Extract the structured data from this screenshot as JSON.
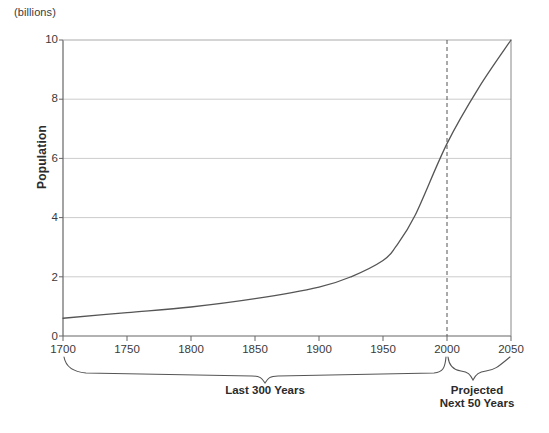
{
  "chart_data": {
    "type": "line",
    "title": "",
    "subtitle": "",
    "units_note": "(billions)",
    "xlabel": "",
    "ylabel": "Population",
    "xlim": [
      1700,
      2050
    ],
    "ylim": [
      0,
      10
    ],
    "grid": true,
    "grid_axis": "y",
    "legend": "none",
    "x_ticks": [
      "1700",
      "1750",
      "1800",
      "1850",
      "1900",
      "1950",
      "2000",
      "2050"
    ],
    "x_tick_values": [
      1700,
      1750,
      1800,
      1850,
      1900,
      1950,
      2000,
      2050
    ],
    "y_ticks": [
      "0",
      "2",
      "4",
      "6",
      "8",
      "10"
    ],
    "y_tick_values": [
      0,
      2,
      4,
      6,
      8,
      10
    ],
    "series": [
      {
        "name": "World Population",
        "x": [
          1700,
          1750,
          1800,
          1850,
          1900,
          1925,
          1950,
          1960,
          1975,
          2000,
          2025,
          2050
        ],
        "values": [
          0.6,
          0.79,
          0.98,
          1.26,
          1.65,
          2.0,
          2.55,
          3.02,
          4.07,
          6.5,
          8.4,
          10.0
        ]
      }
    ],
    "annotations": [
      {
        "name": "projection-divider",
        "type": "vline",
        "x": 2000,
        "style": "dashed"
      },
      {
        "name": "brace-last-300-years",
        "type": "brace",
        "x_start": 1700,
        "x_end": 2000,
        "label": "Last 300 Years"
      },
      {
        "name": "brace-projected",
        "type": "brace",
        "x_start": 2000,
        "x_end": 2050,
        "label": "Projected\nNext 50 Years"
      }
    ]
  },
  "axis": {
    "units_note": "(billions)",
    "y_title": "Population",
    "y_ticks": [
      "10",
      "8",
      "6",
      "4",
      "2",
      "0"
    ],
    "x_ticks": [
      "1700",
      "1750",
      "1800",
      "1850",
      "1900",
      "1950",
      "2000",
      "2050"
    ]
  },
  "braces": {
    "left_label": "Last 300 Years",
    "right_label_line1": "Projected",
    "right_label_line2": "Next 50 Years"
  },
  "colors": {
    "curve": "#555555",
    "axis": "#555555",
    "grid": "#cccccc",
    "text": "#333333",
    "background": "#ffffff"
  }
}
